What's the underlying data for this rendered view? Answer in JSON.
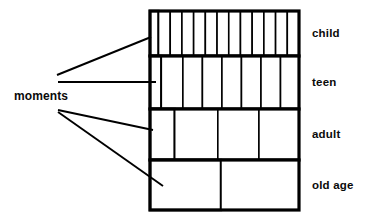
{
  "diagram": {
    "left_label": {
      "text": "moments"
    },
    "stage_labels": [
      {
        "id": "child",
        "text": "child"
      },
      {
        "id": "teen",
        "text": "teen"
      },
      {
        "id": "adult",
        "text": "adult"
      },
      {
        "id": "old-age",
        "text": "old age"
      }
    ],
    "colors": {
      "stroke": "#000000",
      "fill": "#ffffff",
      "background": "#ffffff",
      "text": "#0a0a0a"
    }
  },
  "chart_data": {
    "type": "table",
    "title": "moments",
    "xlabel": "",
    "ylabel": "",
    "grid": true,
    "legend": "none",
    "box": {
      "x": 150,
      "y": 11,
      "width": 149,
      "height": 199
    },
    "categories": [
      "child",
      "teen",
      "adult",
      "old age"
    ],
    "values": [
      13,
      8,
      4,
      2
    ],
    "rows": [
      {
        "label": "child",
        "y": 11,
        "height": 45,
        "moment_count": 13,
        "cell_widths": [
          8,
          11,
          11,
          11,
          11,
          11,
          11,
          11,
          11,
          11,
          11,
          11,
          11
        ]
      },
      {
        "label": "teen",
        "y": 56,
        "height": 53,
        "moment_count": 8,
        "cell_widths": [
          11,
          21,
          19,
          19,
          19,
          19,
          19,
          18
        ]
      },
      {
        "label": "adult",
        "y": 109,
        "height": 51,
        "moment_count": 4,
        "cell_widths": [
          24,
          42,
          40,
          39
        ]
      },
      {
        "label": "old age",
        "y": 160,
        "height": 50,
        "moment_count": 2,
        "cell_widths": [
          70,
          77
        ]
      }
    ],
    "leaders": [
      {
        "from": [
          57,
          75
        ],
        "to": [
          151,
          37
        ],
        "target_row": "child"
      },
      {
        "from": [
          58,
          82
        ],
        "to": [
          156,
          82
        ],
        "target_row": "teen"
      },
      {
        "from": [
          58,
          110
        ],
        "to": [
          153,
          130
        ],
        "target_row": "adult"
      },
      {
        "from": [
          58,
          112
        ],
        "to": [
          163,
          186
        ],
        "target_row": "old age"
      }
    ]
  }
}
